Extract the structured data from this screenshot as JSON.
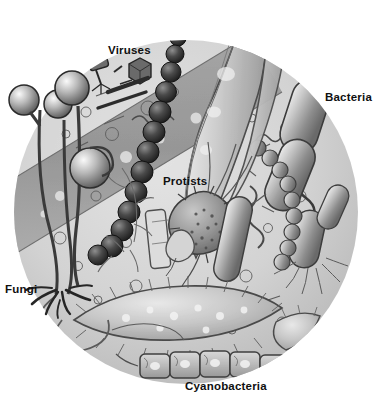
{
  "figure": {
    "background_color": "#ffffff",
    "circle_fill": "#d2d2d2",
    "ink_color": "#2b2b2b",
    "label_color": "#101010"
  },
  "labels": [
    {
      "id": "viruses",
      "text": "Viruses",
      "x": 108,
      "y": 44
    },
    {
      "id": "bacteria",
      "text": "Bacteria",
      "x": 325,
      "y": 91
    },
    {
      "id": "protists",
      "text": "Protists",
      "x": 163,
      "y": 175
    },
    {
      "id": "fungi",
      "text": "Fungi",
      "x": 5,
      "y": 283
    },
    {
      "id": "cyanobacteria",
      "text": "Cyanobacteria",
      "x": 185,
      "y": 380
    }
  ],
  "organisms": {
    "viruses": "bacteriophage and icosahedral virus particles, upper left",
    "bacteria": "large rod-shaped bacilli, spirochetes, flagellated rods, right side",
    "protists": "granular amoeba with pseudopodia, ribbon-like flagellate, large ciliate",
    "fungi": "sporangiophore stalks with round spore heads, rhizoids and looping stolons",
    "cyanobacteria": "filamentous chain of rectangular cells along the bottom",
    "streptococci": "dark beaded chain of spheres running diagonally through centre"
  }
}
